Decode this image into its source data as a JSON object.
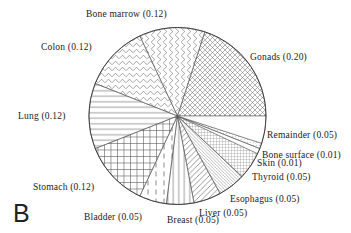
{
  "figure_label": "B",
  "chart_data": {
    "type": "pie",
    "title": "",
    "legend_position": "around",
    "start_angle_deg": 0,
    "direction": "counterclockwise",
    "total": 1.0,
    "slices": [
      {
        "label": "Gonads",
        "value": 0.2,
        "display": "Gonads (0.20)",
        "pattern": "diagcross",
        "pattern_desc": "diagonal crosshatch"
      },
      {
        "label": "Bone marrow",
        "value": 0.12,
        "display": "Bone marrow (0.12)",
        "pattern": "zigzagv",
        "pattern_desc": "vertical zigzag"
      },
      {
        "label": "Colon",
        "value": 0.12,
        "display": "Colon (0.12)",
        "pattern": "zigzagh",
        "pattern_desc": "horizontal zigzag"
      },
      {
        "label": "Lung",
        "value": 0.12,
        "display": "Lung (0.12)",
        "pattern": "hlines",
        "pattern_desc": "horizontal lines"
      },
      {
        "label": "Stomach",
        "value": 0.12,
        "display": "Stomach (0.12)",
        "pattern": "grid",
        "pattern_desc": "square grid"
      },
      {
        "label": "Bladder",
        "value": 0.05,
        "display": "Bladder (0.05)",
        "pattern": "vdash",
        "pattern_desc": "vertical dashed lines"
      },
      {
        "label": "Breast",
        "value": 0.05,
        "display": "Breast (0.05)",
        "pattern": "vlines",
        "pattern_desc": "vertical lines"
      },
      {
        "label": "Liver",
        "value": 0.05,
        "display": "Liver (0.05)",
        "pattern": "diagf",
        "pattern_desc": "forward diagonal lines"
      },
      {
        "label": "Esophagus",
        "value": 0.05,
        "display": "Esophagus (0.05)",
        "pattern": "diagb",
        "pattern_desc": "fine back diagonal lines"
      },
      {
        "label": "Thyroid",
        "value": 0.05,
        "display": "Thyroid (0.05)",
        "pattern": "finegrid",
        "pattern_desc": "fine grid"
      },
      {
        "label": "Skin",
        "value": 0.01,
        "display": "Skin (0.01)",
        "pattern": "plain",
        "pattern_desc": "plain white"
      },
      {
        "label": "Bone surface",
        "value": 0.01,
        "display": "Bone surface (0.01)",
        "pattern": "dots",
        "pattern_desc": "fine dots"
      },
      {
        "label": "Remainder",
        "value": 0.05,
        "display": "Remainder (0.05)",
        "pattern": "plain",
        "pattern_desc": "plain white"
      }
    ],
    "colors": {
      "ink": "#555555",
      "outline": "#333333",
      "background": "#ffffff"
    }
  }
}
